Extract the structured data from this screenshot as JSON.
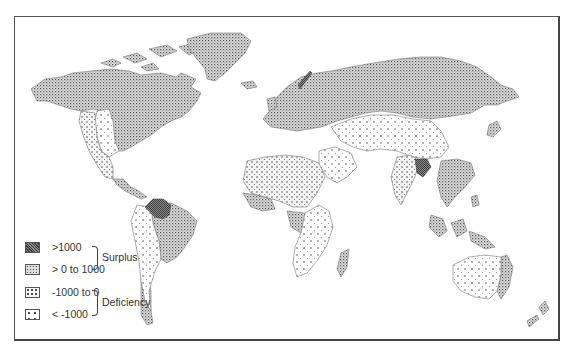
{
  "figure": {
    "type": "world choropleth map",
    "background": "#ffffff",
    "frame_color": "#555555"
  },
  "legend": {
    "items": [
      {
        "label": ">1000",
        "pattern": "dense-crosshatch",
        "group": "surplus"
      },
      {
        "label": "> 0 to 1000",
        "pattern": "fine-dots-dense",
        "group": "surplus"
      },
      {
        "label": "-1000 to 0",
        "pattern": "medium-dots",
        "group": "deficiency"
      },
      {
        "label": "< -1000",
        "pattern": "sparse-dots",
        "group": "deficiency"
      }
    ],
    "groups": {
      "surplus": "Surplus",
      "deficiency": "Deficiency"
    }
  },
  "regions": [
    {
      "name": "Canada & northern USA",
      "category": "> 0 to 1000"
    },
    {
      "name": "Alaska",
      "category": "> 0 to 1000"
    },
    {
      "name": "Greenland",
      "category": "> 0 to 1000"
    },
    {
      "name": "Western USA (Great Plains)",
      "category": "< -1000"
    },
    {
      "name": "Southwest USA & Mexico",
      "category": "-1000 to 0"
    },
    {
      "name": "Central America",
      "category": "> 0 to 1000"
    },
    {
      "name": "Northern South America (Amazon/Guianas)",
      "category": ">1000"
    },
    {
      "name": "Brazil (east)",
      "category": "> 0 to 1000"
    },
    {
      "name": "Western South America",
      "category": "< -1000"
    },
    {
      "name": "Southern Chile",
      "category": "> 0 to 1000"
    },
    {
      "name": "Scandinavia coast (Norway)",
      "category": ">1000"
    },
    {
      "name": "Europe & Russia",
      "category": "> 0 to 1000"
    },
    {
      "name": "Central Asia & Mongolia",
      "category": "< -1000"
    },
    {
      "name": "Middle East",
      "category": "< -1000"
    },
    {
      "name": "Sahara / North Africa",
      "category": "-1000 to 0"
    },
    {
      "name": "West Africa coast",
      "category": "> 0 to 1000"
    },
    {
      "name": "Central Africa (Congo)",
      "category": "> 0 to 1000"
    },
    {
      "name": "East & Southern Africa",
      "category": "< -1000"
    },
    {
      "name": "Madagascar",
      "category": "> 0 to 1000"
    },
    {
      "name": "India",
      "category": "-1000 to 0"
    },
    {
      "name": "Bangladesh / NE India",
      "category": ">1000"
    },
    {
      "name": "Southeast Asia & China (south)",
      "category": "> 0 to 1000"
    },
    {
      "name": "Indonesia & Philippines",
      "category": "> 0 to 1000"
    },
    {
      "name": "Japan",
      "category": "> 0 to 1000"
    },
    {
      "name": "Australia (interior)",
      "category": "< -1000"
    },
    {
      "name": "Australia (east coast)",
      "category": "> 0 to 1000"
    },
    {
      "name": "New Zealand",
      "category": "> 0 to 1000"
    }
  ]
}
